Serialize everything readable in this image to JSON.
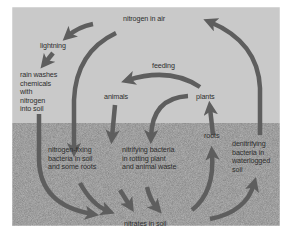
{
  "diagram": {
    "colors": {
      "sky": "#c9c9c9",
      "soil": "#b3b3b3",
      "arrow": "#5e5e5e",
      "text": "#2e2e2e",
      "border": "#ffffff"
    },
    "labels": {
      "nitrogen_air": "nitrogen in air",
      "lightning": "lightning",
      "rain_1": "rain washes",
      "rain_2": "chemicals",
      "rain_3": "with",
      "rain_4": "nitrogen",
      "rain_5": "into soil",
      "feeding": "feeding",
      "animals": "animals",
      "plants": "plants",
      "roots": "roots",
      "nfix_1": "nitrogen-fixing",
      "nfix_2": "bacteria in soil",
      "nfix_3": "and some roots",
      "nitr_1": "nitrifying bacteria",
      "nitr_2": "in rotting plant",
      "nitr_3": "and animal waste",
      "denit_1": "denitrifying",
      "denit_2": "bacteria in",
      "denit_3": "waterlogged",
      "denit_4": "soil",
      "nitrates": "nitrates in soil"
    },
    "arrows": [
      {
        "from": "nitrogen in air",
        "to": "lightning"
      },
      {
        "from": "lightning",
        "to": "rain washes chemicals with nitrogen into soil"
      },
      {
        "from": "rain washes chemicals",
        "to": "nitrogen-fixing bacteria"
      },
      {
        "from": "nitrogen in air",
        "to": "nitrates in soil (via nitrogen-fixing bacteria)"
      },
      {
        "from": "plants",
        "to": "animals",
        "label": "feeding"
      },
      {
        "from": "animals",
        "to": "nitrifying bacteria"
      },
      {
        "from": "plants",
        "to": "nitrifying bacteria"
      },
      {
        "from": "nitrifying bacteria",
        "to": "nitrates in soil"
      },
      {
        "from": "nitrogen-fixing bacteria",
        "to": "nitrates in soil"
      },
      {
        "from": "nitrates in soil",
        "to": "roots"
      },
      {
        "from": "roots",
        "to": "plants"
      },
      {
        "from": "nitrates in soil",
        "to": "denitrifying bacteria"
      },
      {
        "from": "denitrifying bacteria",
        "to": "nitrogen in air"
      }
    ]
  }
}
